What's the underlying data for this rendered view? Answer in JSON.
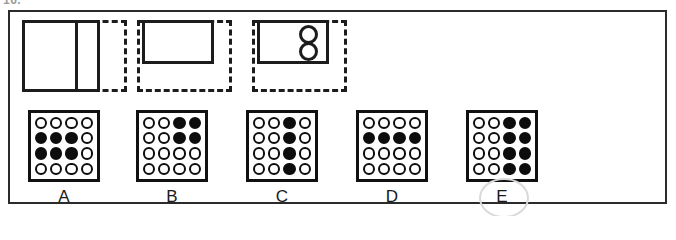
{
  "question_number": "16.",
  "frame": {
    "label": "figure-matrix-question-frame"
  },
  "problem_figures": [
    {
      "id": "figure-1",
      "description": "solid-rectangle-split-vertically-with-dashed-right-edge"
    },
    {
      "id": "figure-2",
      "description": "small-solid-rectangle-top-left-inside-dashed-square"
    },
    {
      "id": "figure-3",
      "description": "small-solid-rectangle-with-two-circles-inside-dashed-square"
    }
  ],
  "options": [
    {
      "label": "A",
      "selected": false,
      "grid": [
        [
          "white",
          "white",
          "white",
          "white"
        ],
        [
          "black",
          "black",
          "black",
          "white"
        ],
        [
          "black",
          "black",
          "black",
          "white"
        ],
        [
          "white",
          "white",
          "white",
          "white"
        ]
      ]
    },
    {
      "label": "B",
      "selected": false,
      "grid": [
        [
          "white",
          "white",
          "black",
          "black"
        ],
        [
          "white",
          "white",
          "black",
          "black"
        ],
        [
          "white",
          "white",
          "white",
          "white"
        ],
        [
          "white",
          "white",
          "white",
          "white"
        ]
      ]
    },
    {
      "label": "C",
      "selected": false,
      "grid": [
        [
          "white",
          "white",
          "black",
          "white"
        ],
        [
          "white",
          "white",
          "black",
          "white"
        ],
        [
          "white",
          "white",
          "black",
          "white"
        ],
        [
          "white",
          "white",
          "black",
          "white"
        ]
      ]
    },
    {
      "label": "D",
      "selected": false,
      "grid": [
        [
          "white",
          "white",
          "white",
          "white"
        ],
        [
          "black",
          "black",
          "black",
          "black"
        ],
        [
          "white",
          "white",
          "white",
          "white"
        ],
        [
          "white",
          "white",
          "white",
          "white"
        ]
      ]
    },
    {
      "label": "E",
      "selected": true,
      "grid": [
        [
          "white",
          "white",
          "black",
          "black"
        ],
        [
          "white",
          "white",
          "black",
          "black"
        ],
        [
          "white",
          "white",
          "black",
          "black"
        ],
        [
          "white",
          "white",
          "black",
          "black"
        ]
      ]
    }
  ],
  "colors": {
    "ink": "#1c1c1c",
    "dot_fill_black": "#0d0d0d",
    "dot_fill_white": "#ffffff",
    "annotation": "#d9d9d9",
    "paper": "#ffffff"
  }
}
